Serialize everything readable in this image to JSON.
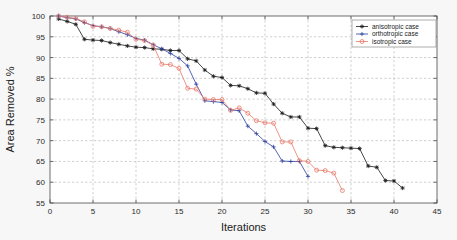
{
  "chart_data": {
    "type": "line",
    "title": "",
    "xlabel": "Iterations",
    "ylabel": "Area Removed %",
    "xlim": [
      0,
      45
    ],
    "ylim": [
      55,
      100
    ],
    "xticks": [
      0,
      5,
      10,
      15,
      20,
      25,
      30,
      35,
      40,
      45
    ],
    "yticks": [
      55,
      60,
      65,
      70,
      75,
      80,
      85,
      90,
      95,
      100
    ],
    "grid": true,
    "legend_position": "top-right",
    "series": [
      {
        "name": "anisotropic case",
        "color": "#1a1a1a",
        "marker": "star",
        "x": [
          1,
          2,
          3,
          4,
          5,
          6,
          7,
          8,
          9,
          10,
          11,
          12,
          13,
          14,
          15,
          16,
          17,
          18,
          19,
          20,
          21,
          22,
          23,
          24,
          25,
          26,
          27,
          28,
          29,
          30,
          31,
          32,
          33,
          34,
          35,
          36,
          37,
          38,
          39,
          40,
          41
        ],
        "y": [
          99.3,
          98.7,
          98.0,
          94.4,
          94.2,
          94.1,
          93.6,
          93.2,
          92.8,
          92.5,
          92.4,
          92.1,
          92.0,
          91.7,
          91.7,
          89.7,
          89.2,
          87.0,
          85.5,
          85.2,
          83.3,
          83.2,
          82.5,
          81.5,
          81.4,
          78.8,
          76.6,
          75.7,
          75.7,
          73.0,
          72.9,
          68.8,
          68.4,
          68.3,
          68.2,
          68.1,
          63.9,
          63.6,
          60.4,
          60.3,
          58.6
        ]
      },
      {
        "name": "orthotropic case",
        "color": "#2b3fa0",
        "marker": "plus",
        "x": [
          1,
          2,
          3,
          4,
          5,
          6,
          7,
          8,
          9,
          10,
          11,
          12,
          13,
          14,
          15,
          16,
          17,
          18,
          19,
          20,
          21,
          22,
          23,
          24,
          25,
          26,
          27,
          28,
          29,
          30
        ],
        "y": [
          100.0,
          99.6,
          99.3,
          98.4,
          97.7,
          97.4,
          97.0,
          96.2,
          95.5,
          94.6,
          94.2,
          93.1,
          92.1,
          91.0,
          89.8,
          88.0,
          83.6,
          79.6,
          79.4,
          79.2,
          77.4,
          77.2,
          73.5,
          71.7,
          69.8,
          68.5,
          65.1,
          65.0,
          65.0,
          61.4
        ]
      },
      {
        "name": "isotropic case",
        "color": "#e8796a",
        "marker": "circle",
        "x": [
          1,
          2,
          3,
          4,
          5,
          6,
          7,
          8,
          9,
          10,
          11,
          12,
          13,
          14,
          15,
          16,
          17,
          18,
          19,
          20,
          21,
          22,
          23,
          24,
          25,
          26,
          27,
          28,
          29,
          30,
          31,
          32,
          33,
          34
        ],
        "y": [
          100.0,
          99.7,
          99.4,
          98.6,
          97.5,
          97.4,
          97.0,
          96.6,
          96.1,
          94.4,
          94.1,
          93.0,
          88.4,
          88.3,
          87.4,
          82.6,
          82.4,
          80.0,
          79.9,
          79.9,
          77.3,
          77.9,
          76.6,
          74.8,
          74.3,
          74.2,
          69.7,
          69.7,
          65.2,
          65.0,
          62.9,
          62.8,
          62.2,
          58.0
        ]
      }
    ]
  },
  "legend": {
    "items": [
      {
        "label": "anisotropic case"
      },
      {
        "label": "orthotropic case"
      },
      {
        "label": "isotropic case"
      }
    ]
  }
}
